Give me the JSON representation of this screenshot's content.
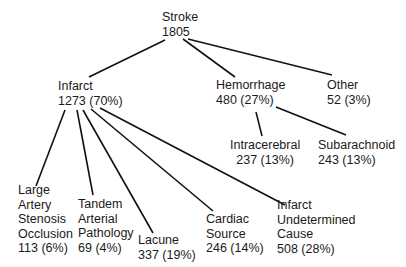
{
  "diagram": {
    "type": "tree",
    "root": {
      "label": "Stroke",
      "value": "1805"
    },
    "level1": [
      {
        "id": "infarct",
        "label": "Infarct",
        "value": "1273 (70%)"
      },
      {
        "id": "hemorrhage",
        "label": "Hemorrhage",
        "value": "480 (27%)"
      },
      {
        "id": "other",
        "label": "Other",
        "value": "52 (3%)"
      }
    ],
    "hemorrhage_children": [
      {
        "id": "intracerebral",
        "label": "Intracerebral",
        "value": "237 (13%)"
      },
      {
        "id": "subarachnoid",
        "label": "Subarachnoid",
        "value": "243 (13%)"
      }
    ],
    "infarct_children": [
      {
        "id": "large-artery",
        "lines": [
          "Large",
          "Artery",
          "Stenosis",
          "Occlusion"
        ],
        "value": "113 (6%)"
      },
      {
        "id": "tandem-arterial",
        "lines": [
          "Tandem",
          "Arterial",
          "Pathology"
        ],
        "value": "69 (4%)"
      },
      {
        "id": "lacune",
        "lines": [
          "Lacune"
        ],
        "value": "337 (19%)"
      },
      {
        "id": "cardiac-source",
        "lines": [
          "Cardiac",
          "Source"
        ],
        "value": "246 (14%)"
      },
      {
        "id": "infarct-undetermined",
        "lines": [
          "Infarct",
          "Undetermined",
          "Cause"
        ],
        "value": "508 (28%)"
      }
    ],
    "line_color": "#111111"
  }
}
